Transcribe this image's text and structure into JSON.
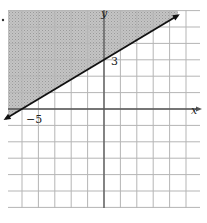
{
  "chart_data": {
    "type": "line",
    "title": "",
    "xlabel": "x",
    "ylabel": "y",
    "xlim": [
      -6,
      6
    ],
    "ylim": [
      -6,
      6
    ],
    "grid": true,
    "grid_step": 1,
    "boundary_line": {
      "equation": "y = (3/5)x + 3",
      "slope": 0.6,
      "intercept": 3,
      "style": "solid",
      "arrows": "both",
      "points": [
        {
          "x": -5,
          "y": 0,
          "label": "-5"
        },
        {
          "x": 0,
          "y": 3,
          "label": "3"
        }
      ]
    },
    "shaded_region": "above",
    "inequality": "y >= (3/5)x + 3",
    "annotations": [
      {
        "text": "-5",
        "x": -5,
        "y": 0,
        "position": "below-right"
      },
      {
        "text": "3",
        "x": 0,
        "y": 3,
        "position": "right"
      }
    ],
    "colors": {
      "shade": "#b8b8b8",
      "grid": "#b0b0b0",
      "axis": "#444444",
      "line": "#111111"
    }
  },
  "labels": {
    "x_axis": "x",
    "y_axis": "y",
    "x_intercept": "−5",
    "y_intercept": "3"
  }
}
